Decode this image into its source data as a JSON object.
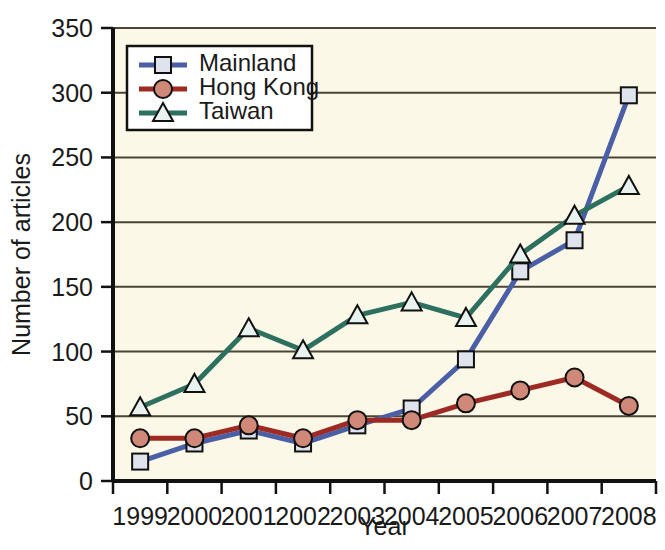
{
  "chart_data": {
    "type": "line",
    "title": "",
    "xlabel": "Year",
    "ylabel": "Number of articles",
    "categories": [
      "1999",
      "2000",
      "2001",
      "2002",
      "2003",
      "2004",
      "2005",
      "2006",
      "2007",
      "2008"
    ],
    "x": [
      1999,
      2000,
      2001,
      2002,
      2003,
      2004,
      2005,
      2006,
      2007,
      2008
    ],
    "xlim": [
      1999,
      2008
    ],
    "ylim": [
      0,
      350
    ],
    "yticks": [
      0,
      50,
      100,
      150,
      200,
      250,
      300,
      350
    ],
    "ytick_labels": [
      "0",
      "50",
      "100",
      "150",
      "200",
      "250",
      "300",
      "350"
    ],
    "xtick_labels": [
      "1999",
      "2000",
      "2001",
      "2002",
      "2003",
      "2004",
      "2005",
      "2006",
      "2007",
      "2008"
    ],
    "grid": "horizontal",
    "legend_position": "top-left-inside",
    "series": [
      {
        "name": "Mainland",
        "color": "#4a5fa5",
        "marker": "square",
        "marker_fill": "#dfe3ee",
        "values": [
          15,
          29,
          39,
          29,
          43,
          56,
          94,
          162,
          186,
          298
        ]
      },
      {
        "name": "Hong Kong",
        "color": "#9e2a24",
        "marker": "circle",
        "marker_fill": "#d08878",
        "values": [
          33,
          33,
          43,
          33,
          47,
          47,
          60,
          70,
          80,
          58
        ]
      },
      {
        "name": "Taiwan",
        "color": "#2d7060",
        "marker": "triangle",
        "marker_fill": "#e8f2ee",
        "values": [
          57,
          75,
          118,
          101,
          128,
          138,
          126,
          175,
          205,
          228
        ]
      }
    ]
  },
  "legend": {
    "entries": [
      {
        "label": "Mainland"
      },
      {
        "label": "Hong Kong"
      },
      {
        "label": "Taiwan"
      }
    ]
  },
  "axes": {
    "y_title": "Number of articles",
    "x_title": "Year"
  },
  "colors": {
    "plot_background": "#fbf8e8",
    "page_background": "#ffffff",
    "gridline": "#4a4637",
    "axis": "#111111",
    "mainland": "#4a5fa5",
    "hongkong": "#9e2a24",
    "taiwan": "#2d7060"
  }
}
